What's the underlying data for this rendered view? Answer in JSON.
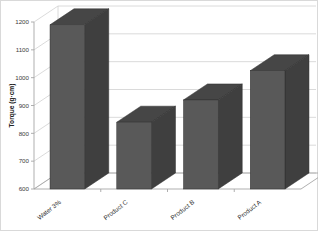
{
  "chart_data": {
    "type": "bar",
    "title": "",
    "xlabel": "",
    "ylabel": "Torque (g·cm)",
    "categories": [
      "Water 3%",
      "Product C",
      "Product B",
      "Product A"
    ],
    "values": [
      1190,
      840,
      920,
      1025
    ],
    "ylim": [
      600,
      1200
    ],
    "yticks": [
      600,
      700,
      800,
      900,
      1000,
      1100,
      1200
    ],
    "ytick_labels": [
      "600",
      "700",
      "800",
      "900",
      "1000",
      "1100",
      "1200"
    ],
    "grid": true,
    "legend": "none",
    "style": "3d-column",
    "series": [
      {
        "name": "Torque",
        "values": [
          1190,
          840,
          920,
          1025
        ]
      }
    ],
    "colors": {
      "bar_front": "#595959",
      "bar_top": "#464646",
      "bar_side": "#3f3f3f",
      "gridline": "#d0d0d0",
      "axis": "#a6a6a6",
      "border": "#d9d9d9",
      "text": "#2e2e2e"
    }
  }
}
